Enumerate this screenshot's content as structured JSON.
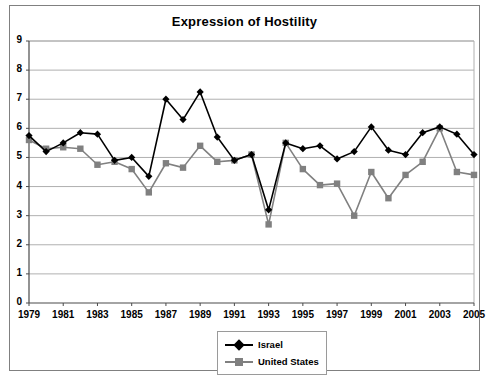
{
  "chart": {
    "title": "Expression of Hostility",
    "frame_border_color": "#808080",
    "background_color": "#ffffff"
  },
  "legend": {
    "position": "bottom-center",
    "entries": [
      {
        "label": "Israel",
        "color": "#000000",
        "marker": "diamond"
      },
      {
        "label": "United States",
        "color": "#808080",
        "marker": "square"
      }
    ]
  },
  "chart_data": {
    "type": "line",
    "title": "Expression of Hostility",
    "xlabel": "",
    "ylabel": "",
    "xlim": [
      1979,
      2005
    ],
    "ylim": [
      0,
      9
    ],
    "ytick_labels": [
      "0",
      "1",
      "2",
      "3",
      "4",
      "5",
      "6",
      "7",
      "8",
      "9"
    ],
    "yticks": [
      0,
      1,
      2,
      3,
      4,
      5,
      6,
      7,
      8,
      9
    ],
    "xtick_labels": [
      "1979",
      "1981",
      "1983",
      "1985",
      "1987",
      "1989",
      "1991",
      "1993",
      "1995",
      "1997",
      "1999",
      "2001",
      "2003",
      "2005"
    ],
    "xticks": [
      1979,
      1981,
      1983,
      1985,
      1987,
      1989,
      1991,
      1993,
      1995,
      1997,
      1999,
      2001,
      2003,
      2005
    ],
    "grid": "horizontal",
    "legend_position": "bottom-center",
    "x": [
      1979,
      1980,
      1981,
      1982,
      1983,
      1984,
      1985,
      1986,
      1987,
      1988,
      1989,
      1990,
      1991,
      1992,
      1993,
      1994,
      1995,
      1996,
      1997,
      1998,
      1999,
      2000,
      2001,
      2002,
      2003,
      2004,
      2005
    ],
    "series": [
      {
        "name": "Israel",
        "color": "#000000",
        "marker": "diamond",
        "values": [
          5.75,
          5.2,
          5.5,
          5.85,
          5.8,
          4.9,
          5.0,
          4.35,
          7.0,
          6.3,
          7.25,
          5.7,
          4.9,
          5.1,
          3.2,
          5.5,
          5.3,
          5.4,
          4.95,
          5.2,
          6.05,
          5.25,
          5.1,
          5.85,
          6.05,
          5.8,
          5.1
        ]
      },
      {
        "name": "United States",
        "color": "#808080",
        "marker": "square",
        "values": [
          5.6,
          5.3,
          5.35,
          5.3,
          4.75,
          4.85,
          4.6,
          3.8,
          4.8,
          4.65,
          5.4,
          4.85,
          4.9,
          5.1,
          2.7,
          5.5,
          4.6,
          4.05,
          4.1,
          3.0,
          4.5,
          3.6,
          4.4,
          4.85,
          6.0,
          4.5,
          4.4
        ]
      }
    ]
  }
}
